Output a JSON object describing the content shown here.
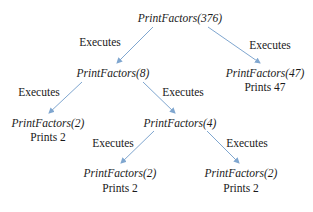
{
  "diagram": {
    "edge_label": "Executes",
    "colors": {
      "arrow": "#7fa6cf",
      "text": "#1a1a1a"
    },
    "nodes": [
      {
        "id": "n376",
        "call": "PrintFactors(376)",
        "output": null,
        "x": 180,
        "y": 18
      },
      {
        "id": "n8",
        "call": "PrintFactors(8)",
        "output": null,
        "x": 113,
        "y": 73
      },
      {
        "id": "n47",
        "call": "PrintFactors(47)",
        "output": "Prints 47",
        "x": 265,
        "y": 73
      },
      {
        "id": "n2a",
        "call": "PrintFactors(2)",
        "output": "Prints 2",
        "x": 48,
        "y": 123
      },
      {
        "id": "n4",
        "call": "PrintFactors(4)",
        "output": null,
        "x": 180,
        "y": 123
      },
      {
        "id": "n2b",
        "call": "PrintFactors(2)",
        "output": "Prints 2",
        "x": 120,
        "y": 173
      },
      {
        "id": "n2c",
        "call": "PrintFactors(2)",
        "output": "Prints 2",
        "x": 241,
        "y": 173
      }
    ],
    "edges": [
      {
        "from": "n376",
        "to": "n8",
        "label": "Executes"
      },
      {
        "from": "n376",
        "to": "n47",
        "label": "Executes"
      },
      {
        "from": "n8",
        "to": "n2a",
        "label": "Executes"
      },
      {
        "from": "n8",
        "to": "n4",
        "label": "Executes"
      },
      {
        "from": "n4",
        "to": "n2b",
        "label": "Executes"
      },
      {
        "from": "n4",
        "to": "n2c",
        "label": "Executes"
      }
    ]
  }
}
